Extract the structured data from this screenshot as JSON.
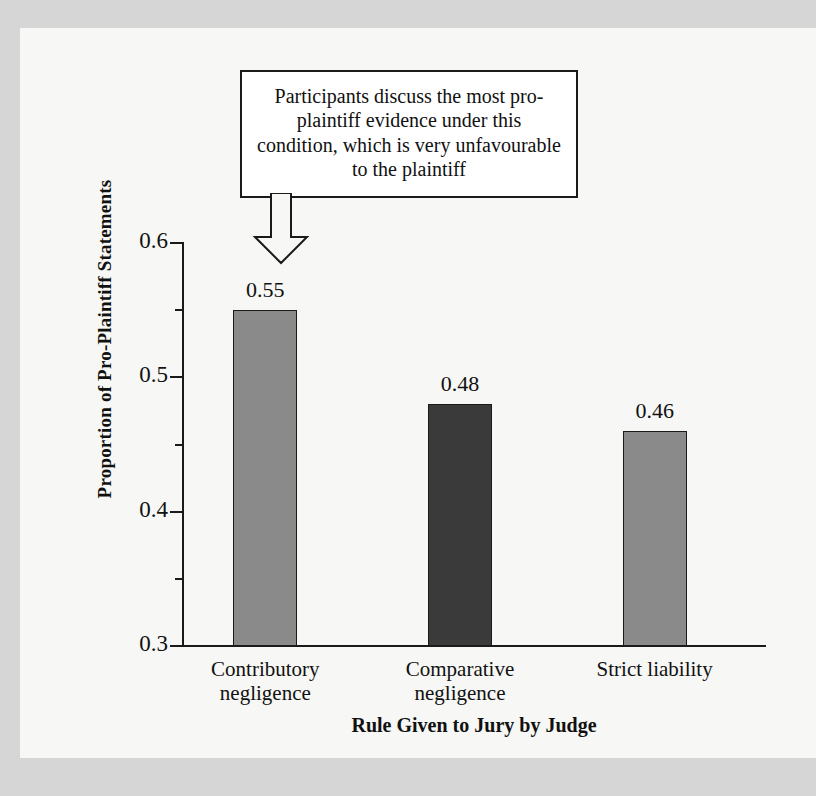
{
  "figure": {
    "background_color": "#f7f7f5",
    "page_border_color": "#d6d6d6"
  },
  "annotation": {
    "text": "Participants discuss the most pro-plaintiff evidence under this condition, which is very unfavourable to the plaintiff",
    "arrow": "down-arrow-icon",
    "points_to": "Contributory negligence"
  },
  "axes": {
    "y_title": "Proportion of Pro-Plaintiff Statements",
    "x_title": "Rule Given to Jury by Judge",
    "y_ticks": [
      "0.6",
      "0.5",
      "0.4",
      "0.3"
    ],
    "y_min": 0.3,
    "y_max": 0.6
  },
  "chart_data": {
    "type": "bar",
    "title": "",
    "categories": [
      "Contributory negligence",
      "Comparative negligence",
      "Strict liability"
    ],
    "category_lines": [
      [
        "Contributory",
        "negligence"
      ],
      [
        "Comparative",
        "negligence"
      ],
      [
        "Strict liability"
      ]
    ],
    "values": [
      0.55,
      0.48,
      0.46
    ],
    "value_labels": [
      "0.55",
      "0.48",
      "0.46"
    ],
    "bar_colors": [
      "#8a8a8a",
      "#3a3a3a",
      "#8a8a8a"
    ],
    "xlabel": "Rule Given to Jury by Judge",
    "ylabel": "Proportion of Pro-Plaintiff Statements",
    "ylim": [
      0.3,
      0.6
    ],
    "yticks": [
      0.3,
      0.4,
      0.5,
      0.6
    ],
    "minor_ticks": [
      0.35,
      0.45,
      0.55
    ],
    "grid": false,
    "legend": false,
    "annotations": [
      {
        "text": "Participants discuss the most pro-plaintiff evidence under this condition, which is very unfavourable to the plaintiff",
        "target_category": "Contributory negligence"
      }
    ]
  }
}
